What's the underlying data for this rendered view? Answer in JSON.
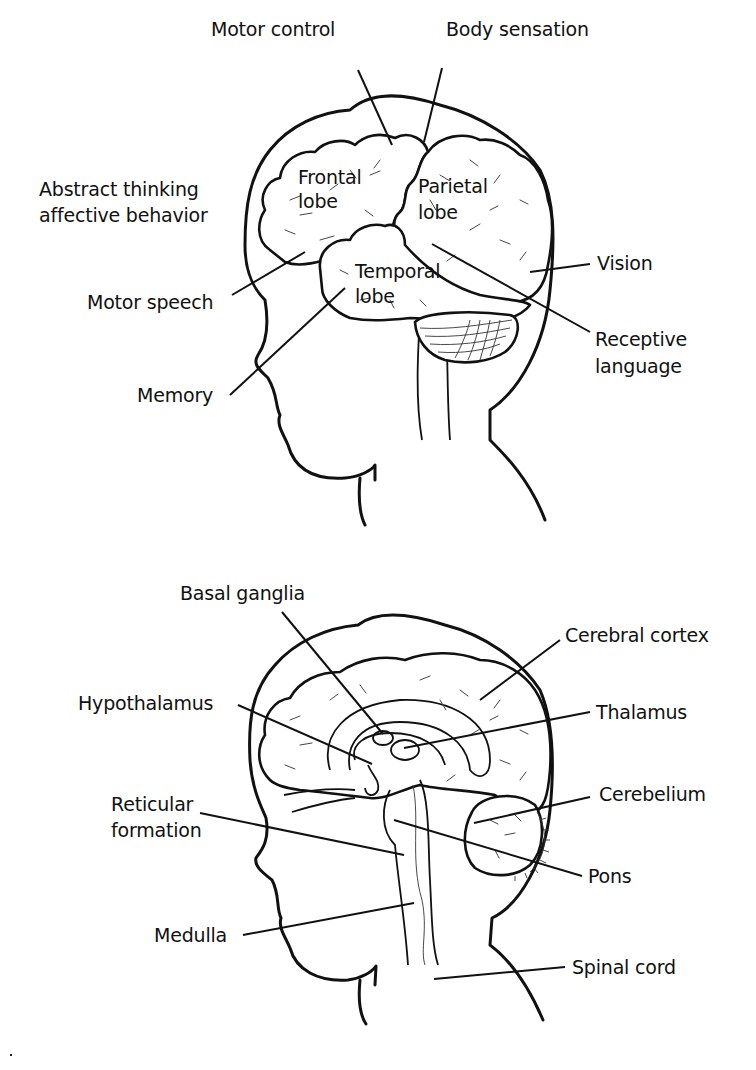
{
  "figure": {
    "panels": [
      {
        "id": "lateral-view",
        "description": "Lateral view of the brain within a head silhouette, showing lobes and functional areas",
        "lobe_labels": [
          "Frontal lobe",
          "Parietal lobe",
          "Temporal lobe"
        ],
        "function_labels": [
          "Motor control",
          "Body sensation",
          "Abstract thinking affective behavior",
          "Vision",
          "Motor speech",
          "Receptive language",
          "Memory"
        ]
      },
      {
        "id": "sagittal-view",
        "description": "Mid-sagittal view of the brain within a head silhouette, showing internal structures",
        "structure_labels": [
          "Basal ganglia",
          "Cerebral cortex",
          "Hypothalamus",
          "Thalamus",
          "Cerebelium",
          "Reticular formation",
          "Pons",
          "Medulla",
          "Spinal cord"
        ]
      }
    ]
  },
  "top": {
    "motor_control": "Motor control",
    "body_sensation": "Body sensation",
    "abstract_line1": "Abstract thinking",
    "abstract_line2": "affective behavior",
    "frontal_line1": "Frontal",
    "frontal_line2": "lobe",
    "parietal_line1": "Parietal",
    "parietal_line2": "lobe",
    "temporal_line1": "Temporal",
    "temporal_line2": "lobe",
    "vision": "Vision",
    "motor_speech": "Motor speech",
    "receptive_line1": "Receptive",
    "receptive_line2": "language",
    "memory": "Memory"
  },
  "bottom": {
    "basal_ganglia": "Basal ganglia",
    "cerebral_cortex": "Cerebral cortex",
    "hypothalamus": "Hypothalamus",
    "thalamus": "Thalamus",
    "cerebelium": "Cerebelium",
    "reticular_line1": "Reticular",
    "reticular_line2": "formation",
    "pons": "Pons",
    "medulla": "Medulla",
    "spinal_cord": "Spinal cord"
  },
  "colors": {
    "ink": "#111111",
    "background": "#ffffff"
  }
}
